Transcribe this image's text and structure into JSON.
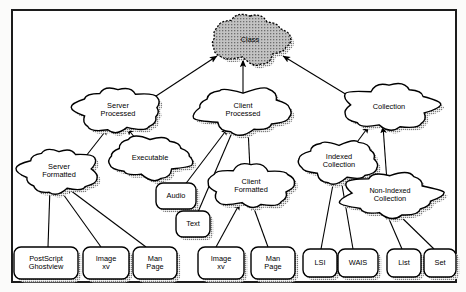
{
  "diagram": {
    "root_fill": "#b4b4b4",
    "node_fill": "#ffffff",
    "stroke": "#000000",
    "shadow": "#9a9a9a",
    "nodes": [
      {
        "id": "class",
        "label_lines": [
          "Class"
        ],
        "shape": "cloud",
        "shaded": true,
        "cx": 250,
        "cy": 40,
        "rx": 38,
        "ry": 21
      },
      {
        "id": "server-processed",
        "label_lines": [
          "Server",
          "Processed"
        ],
        "shape": "cloud",
        "shaded": false,
        "cx": 118,
        "cy": 110,
        "rx": 42,
        "ry": 20
      },
      {
        "id": "client-processed",
        "label_lines": [
          "Client",
          "Processed"
        ],
        "shape": "cloud",
        "shaded": false,
        "cx": 243,
        "cy": 110,
        "rx": 46,
        "ry": 20
      },
      {
        "id": "collection",
        "label_lines": [
          "Collection"
        ],
        "shape": "cloud",
        "shaded": false,
        "cx": 389,
        "cy": 107,
        "rx": 45,
        "ry": 20
      },
      {
        "id": "server-formatted",
        "label_lines": [
          "Server",
          "Formatted"
        ],
        "shape": "cloud",
        "shaded": false,
        "cx": 59,
        "cy": 171,
        "rx": 38,
        "ry": 20
      },
      {
        "id": "executable",
        "label_lines": [
          "Executable"
        ],
        "shape": "cloud",
        "shaded": false,
        "cx": 150,
        "cy": 158,
        "rx": 40,
        "ry": 18
      },
      {
        "id": "client-formatted",
        "label_lines": [
          "Client",
          "Formatted"
        ],
        "shape": "cloud",
        "shaded": false,
        "cx": 251,
        "cy": 186,
        "rx": 42,
        "ry": 19
      },
      {
        "id": "indexed-collection",
        "label_lines": [
          "Indexed",
          "Collection"
        ],
        "shape": "cloud",
        "shaded": false,
        "cx": 339,
        "cy": 161,
        "rx": 38,
        "ry": 19
      },
      {
        "id": "non-indexed-collection",
        "label_lines": [
          "Non-Indexed",
          "Collection"
        ],
        "shape": "cloud",
        "shaded": false,
        "cx": 390,
        "cy": 195,
        "rx": 47,
        "ry": 19
      },
      {
        "id": "audio",
        "label_lines": [
          "Audio"
        ],
        "shape": "rrect",
        "shaded": false,
        "cx": 176,
        "cy": 196,
        "rx": 20,
        "ry": 13
      },
      {
        "id": "text",
        "label_lines": [
          "Text"
        ],
        "shape": "rrect",
        "shaded": false,
        "cx": 193,
        "cy": 224,
        "rx": 17,
        "ry": 13
      },
      {
        "id": "postscript-ghostview",
        "label_lines": [
          "PostScript",
          "Ghostview"
        ],
        "shape": "rrect",
        "shaded": false,
        "cx": 46,
        "cy": 263,
        "rx": 32,
        "ry": 16
      },
      {
        "id": "image-xv-left",
        "label_lines": [
          "Image",
          "xv"
        ],
        "shape": "rrect",
        "shaded": false,
        "cx": 106,
        "cy": 263,
        "rx": 23,
        "ry": 16
      },
      {
        "id": "man-page-left",
        "label_lines": [
          "Man",
          "Page"
        ],
        "shape": "rrect",
        "shaded": false,
        "cx": 155,
        "cy": 263,
        "rx": 22,
        "ry": 16
      },
      {
        "id": "image-xv-right",
        "label_lines": [
          "Image",
          "xv"
        ],
        "shape": "rrect",
        "shaded": false,
        "cx": 221,
        "cy": 263,
        "rx": 23,
        "ry": 16
      },
      {
        "id": "man-page-right",
        "label_lines": [
          "Man",
          "Page"
        ],
        "shape": "rrect",
        "shaded": false,
        "cx": 273,
        "cy": 263,
        "rx": 22,
        "ry": 16
      },
      {
        "id": "lsi",
        "label_lines": [
          "LSI"
        ],
        "shape": "rrect",
        "shaded": false,
        "cx": 320,
        "cy": 263,
        "rx": 17,
        "ry": 14
      },
      {
        "id": "wais",
        "label_lines": [
          "WAIS"
        ],
        "shape": "rrect",
        "shaded": false,
        "cx": 358,
        "cy": 263,
        "rx": 20,
        "ry": 14
      },
      {
        "id": "list",
        "label_lines": [
          "List"
        ],
        "shape": "rrect",
        "shaded": false,
        "cx": 404,
        "cy": 263,
        "rx": 17,
        "ry": 14
      },
      {
        "id": "set",
        "label_lines": [
          "Set"
        ],
        "shape": "rrect",
        "shaded": false,
        "cx": 440,
        "cy": 263,
        "rx": 16,
        "ry": 14
      }
    ],
    "edges": [
      {
        "from": "server-processed",
        "to": "class",
        "x1": 150,
        "y1": 100,
        "x2": 217,
        "y2": 56
      },
      {
        "from": "client-processed",
        "to": "class",
        "x1": 243,
        "y1": 96,
        "x2": 243,
        "y2": 60
      },
      {
        "from": "collection",
        "to": "class",
        "x1": 352,
        "y1": 98,
        "x2": 283,
        "y2": 56
      },
      {
        "from": "server-formatted",
        "to": "server-processed",
        "x1": 86,
        "y1": 156,
        "x2": 108,
        "y2": 128
      },
      {
        "from": "executable",
        "to": "server-processed",
        "x1": 140,
        "y1": 144,
        "x2": 127,
        "y2": 128
      },
      {
        "from": "audio",
        "to": "client-processed",
        "x1": 184,
        "y1": 186,
        "x2": 228,
        "y2": 128
      },
      {
        "from": "text",
        "to": "client-processed",
        "x1": 198,
        "y1": 212,
        "x2": 234,
        "y2": 128
      },
      {
        "from": "client-formatted",
        "to": "client-processed",
        "x1": 250,
        "y1": 170,
        "x2": 248,
        "y2": 128
      },
      {
        "from": "indexed-collection",
        "to": "collection",
        "x1": 352,
        "y1": 149,
        "x2": 369,
        "y2": 126
      },
      {
        "from": "non-indexed-collection",
        "to": "collection",
        "x1": 387,
        "y1": 182,
        "x2": 383,
        "y2": 126
      },
      {
        "from": "postscript-ghostview",
        "to": "server-formatted",
        "x1": 48,
        "y1": 247,
        "x2": 50,
        "y2": 187
      },
      {
        "from": "image-xv-left",
        "to": "server-formatted",
        "x1": 101,
        "y1": 247,
        "x2": 58,
        "y2": 187
      },
      {
        "from": "man-page-left",
        "to": "server-formatted",
        "x1": 146,
        "y1": 247,
        "x2": 66,
        "y2": 187
      },
      {
        "from": "image-xv-right",
        "to": "client-formatted",
        "x1": 216,
        "y1": 247,
        "x2": 240,
        "y2": 203
      },
      {
        "from": "man-page-right",
        "to": "client-formatted",
        "x1": 268,
        "y1": 247,
        "x2": 252,
        "y2": 203
      },
      {
        "from": "lsi",
        "to": "indexed-collection",
        "x1": 321,
        "y1": 249,
        "x2": 334,
        "y2": 179
      },
      {
        "from": "wais",
        "to": "indexed-collection",
        "x1": 353,
        "y1": 249,
        "x2": 341,
        "y2": 179
      },
      {
        "from": "list",
        "to": "non-indexed-collection",
        "x1": 402,
        "y1": 249,
        "x2": 386,
        "y2": 212
      },
      {
        "from": "set",
        "to": "non-indexed-collection",
        "x1": 434,
        "y1": 249,
        "x2": 396,
        "y2": 212
      }
    ]
  }
}
